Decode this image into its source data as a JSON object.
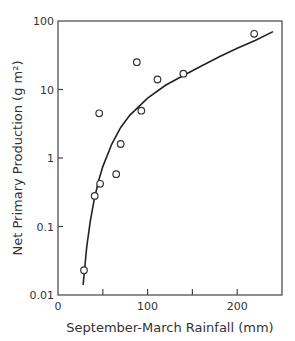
{
  "chart_data": {
    "type": "scatter",
    "title": "",
    "xlabel": "September-March Rainfall (mm)",
    "ylabel": "Net Primary Production (g m²)",
    "xlim": [
      0,
      250
    ],
    "ylim": [
      0.01,
      100
    ],
    "yscale": "log",
    "x_ticks": [
      0,
      50,
      100,
      150,
      200
    ],
    "x_tick_labels": [
      "0",
      "",
      "100",
      "",
      "200"
    ],
    "y_ticks": [
      0.01,
      0.1,
      1,
      10,
      100
    ],
    "y_tick_labels": [
      "0.01",
      "0.1",
      "1",
      "10",
      "100"
    ],
    "grid": false,
    "legend": null,
    "series": [
      {
        "name": "observations",
        "marker": "open-circle",
        "x": [
          29,
          41,
          46,
          47,
          65,
          70,
          88,
          93,
          111,
          140,
          219
        ],
        "y": [
          0.023,
          0.28,
          4.5,
          0.42,
          0.58,
          1.6,
          25,
          4.9,
          14,
          17,
          65
        ]
      },
      {
        "name": "fitted curve",
        "style": "line",
        "x": [
          28,
          32,
          36,
          40,
          45,
          50,
          60,
          70,
          80,
          100,
          120,
          140,
          160,
          180,
          200,
          220,
          240
        ],
        "y": [
          0.014,
          0.05,
          0.12,
          0.23,
          0.45,
          0.75,
          1.6,
          2.8,
          4.2,
          7.5,
          11.5,
          16,
          22,
          30,
          40,
          52,
          70
        ]
      }
    ]
  }
}
